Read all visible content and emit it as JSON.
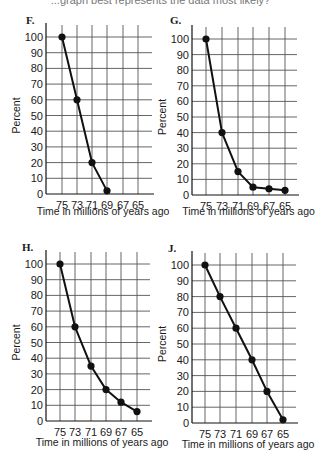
{
  "question_fragment": "...graph best represents the data most likely?",
  "chart_data": [
    {
      "type": "line",
      "panel": "F.",
      "categories": [
        "75",
        "73",
        "71",
        "69",
        "67",
        "65"
      ],
      "x": [
        75,
        73,
        71,
        69
      ],
      "values": [
        100,
        60,
        20,
        2
      ],
      "xlabel": "Time in millions of years ago",
      "ylabel": "Percent",
      "yticks": [
        0,
        10,
        20,
        30,
        40,
        50,
        60,
        70,
        80,
        90,
        100
      ],
      "ylim": [
        0,
        100
      ],
      "grid": true
    },
    {
      "type": "line",
      "panel": "G.",
      "categories": [
        "75",
        "73",
        "71",
        "69",
        "67",
        "65"
      ],
      "x": [
        75,
        73,
        71,
        69,
        67,
        65
      ],
      "values": [
        100,
        40,
        15,
        5,
        4,
        3
      ],
      "xlabel": "Time in millions of years ago",
      "ylabel": "Percent",
      "yticks": [
        0,
        10,
        20,
        30,
        40,
        50,
        60,
        70,
        80,
        90,
        100
      ],
      "ylim": [
        0,
        100
      ],
      "grid": true
    },
    {
      "type": "line",
      "panel": "H.",
      "categories": [
        "75",
        "73",
        "71",
        "69",
        "67",
        "65"
      ],
      "x": [
        75,
        73,
        71,
        69,
        67,
        65
      ],
      "values": [
        100,
        60,
        35,
        20,
        12,
        6
      ],
      "xlabel": "Time in millions of years ago",
      "ylabel": "Percent",
      "yticks": [
        0,
        10,
        20,
        30,
        40,
        50,
        60,
        70,
        80,
        90,
        100
      ],
      "ylim": [
        0,
        100
      ],
      "grid": true
    },
    {
      "type": "line",
      "panel": "J.",
      "categories": [
        "75",
        "73",
        "71",
        "69",
        "67",
        "65"
      ],
      "x": [
        75,
        73,
        71,
        69,
        67,
        65
      ],
      "values": [
        100,
        80,
        60,
        40,
        20,
        2
      ],
      "xlabel": "Time in millions of years ago",
      "ylabel": "Percent",
      "yticks": [
        0,
        10,
        20,
        30,
        40,
        50,
        60,
        70,
        80,
        90,
        100
      ],
      "ylim": [
        0,
        100
      ],
      "grid": true
    }
  ],
  "layout": [
    {
      "axisX": 46,
      "axisY": 194,
      "topY": 37,
      "cols": [
        62,
        77,
        92,
        107,
        123,
        138
      ],
      "right": 152,
      "label": [
        26,
        24
      ],
      "xlabelY": null
    },
    {
      "axisX": 192,
      "axisY": 195,
      "topY": 39,
      "cols": [
        206,
        222,
        238,
        253,
        269,
        285
      ],
      "right": 297,
      "label": [
        170,
        24
      ],
      "xlabelY": 215
    },
    {
      "axisX": 46,
      "axisY": 421,
      "topY": 264,
      "cols": [
        60,
        75,
        91,
        106,
        121,
        137
      ],
      "right": 150,
      "label": [
        22,
        251
      ],
      "xlabelY": 446
    },
    {
      "axisX": 192,
      "axisY": 423,
      "topY": 265,
      "cols": [
        205,
        220,
        236,
        252,
        267,
        283
      ],
      "right": 296,
      "label": [
        168,
        252
      ],
      "xlabelY": 448
    }
  ],
  "first_xlabel_y": 215,
  "colors": {
    "line": "#111111",
    "grid": "#555555",
    "text": "#1a1a1a"
  }
}
